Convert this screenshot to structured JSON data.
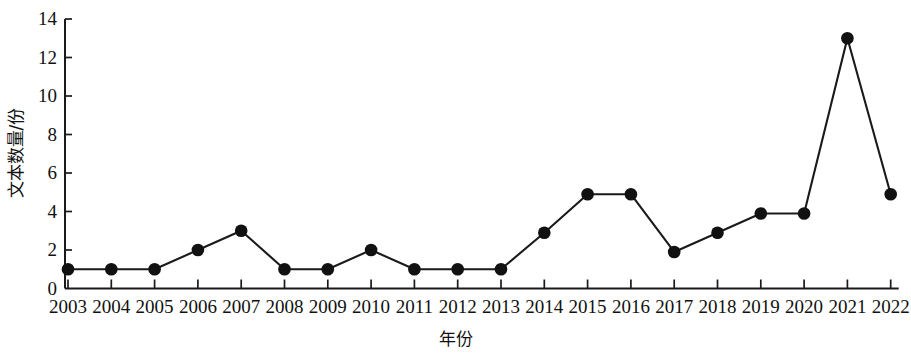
{
  "chart_data": {
    "type": "line",
    "title": "",
    "xlabel": "年份",
    "ylabel": "文本数量/份",
    "x": [
      2003,
      2004,
      2005,
      2006,
      2007,
      2008,
      2009,
      2010,
      2011,
      2012,
      2013,
      2014,
      2015,
      2016,
      2017,
      2018,
      2019,
      2020,
      2021,
      2022
    ],
    "categories": [
      "2003",
      "2004",
      "2005",
      "2006",
      "2007",
      "2008",
      "2009",
      "2010",
      "2011",
      "2012",
      "2013",
      "2014",
      "2015",
      "2016",
      "2017",
      "2018",
      "2019",
      "2020",
      "2021",
      "2022"
    ],
    "values": [
      1,
      1,
      1,
      2,
      3,
      1,
      1,
      2,
      1,
      1,
      1,
      2.9,
      4.9,
      4.9,
      1.9,
      2.9,
      3.9,
      3.9,
      13,
      4.9
    ],
    "series": [
      {
        "name": "文本数量/份",
        "values": [
          1,
          1,
          1,
          2,
          3,
          1,
          1,
          2,
          1,
          1,
          1,
          2.9,
          4.9,
          4.9,
          1.9,
          2.9,
          3.9,
          3.9,
          13,
          4.9
        ]
      }
    ],
    "ylim": [
      0,
      14
    ],
    "xlim": [
      2003,
      2022
    ],
    "y_ticks": [
      0,
      2,
      4,
      6,
      8,
      10,
      12,
      14
    ],
    "y_tick_labels": [
      "0",
      "2",
      "4",
      "6",
      "8",
      "10",
      "12",
      "14"
    ],
    "x_tick_labels": [
      "2003",
      "2004",
      "2005",
      "2006",
      "2007",
      "2008",
      "2009",
      "2010",
      "2011",
      "2012",
      "2013",
      "2014",
      "2015",
      "2016",
      "2017",
      "2018",
      "2019",
      "2020",
      "2021",
      "2022"
    ],
    "grid": false,
    "legend": false,
    "legend_position": "none",
    "marker": "filled-circle",
    "line_color": "#1a1a1a",
    "marker_color": "#111111",
    "axis_color": "#1a1a1a",
    "background_color": "#ffffff"
  }
}
